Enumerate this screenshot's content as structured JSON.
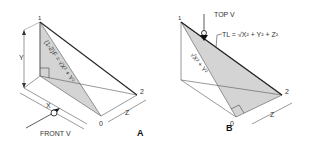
{
  "figure_a": {
    "caption": "A",
    "point_1": "1",
    "point_2": "2",
    "point_0": "0",
    "dim_y": "Y",
    "dim_x": "X",
    "dim_z": "Z",
    "hypotenuse_label": "(1-2)F = √X² + Y²",
    "view_label": "FRONT V"
  },
  "figure_b": {
    "caption": "B",
    "point_1": "1",
    "point_2": "2",
    "point_0": "0",
    "dim_z": "Z",
    "diagonal_label": "√X² + Y²",
    "view_label": "TOP V",
    "true_length_label": "TL = √X² + Y² + Z²"
  },
  "colors": {
    "line": "#222222",
    "thin_line": "#555555",
    "shade": "#d4d4d4"
  }
}
